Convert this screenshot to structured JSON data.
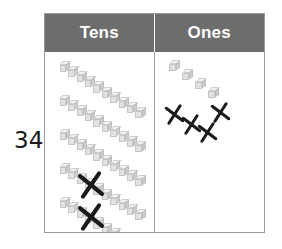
{
  "worksheet": {
    "number_label": "34",
    "table": {
      "columns": [
        {
          "id": "tens",
          "header": "Tens"
        },
        {
          "id": "ones",
          "header": "Ones"
        }
      ],
      "header_bg": "#6d6d6d",
      "header_text_color": "#ffffff",
      "border_color": "#9a9a9a",
      "cell_bg": "#ffffff"
    },
    "tens_column": {
      "manipulative": "rod-of-ten-cubes",
      "cubes_per_rod": 10,
      "rods_shown": 5,
      "rods_crossed_out": 2,
      "rods_remaining": 3,
      "rods": [
        {
          "index": 1,
          "x": 14,
          "y": 9,
          "crossed": false
        },
        {
          "index": 2,
          "x": 14,
          "y": 43,
          "crossed": false
        },
        {
          "index": 3,
          "x": 14,
          "y": 77,
          "crossed": false
        },
        {
          "index": 4,
          "x": 14,
          "y": 111,
          "crossed": true
        },
        {
          "index": 5,
          "x": 14,
          "y": 145,
          "crossed": false
        }
      ],
      "cross_marks": [
        {
          "x": 46,
          "y": 133,
          "size": 26,
          "rotation": -8
        },
        {
          "x": 46,
          "y": 165,
          "size": 26,
          "rotation": -8
        }
      ],
      "cube_color": "#e2e2e2",
      "cube_top_color": "#f3f3f3",
      "cube_side_color": "#cdcdcd"
    },
    "ones_column": {
      "manipulative": "single-unit-cube",
      "cubes_shown": 4,
      "cubes_crossed_out": 4,
      "cubes_remaining": 0,
      "cubes": [
        {
          "index": 1,
          "x": 14,
          "y": 8
        },
        {
          "index": 2,
          "x": 27,
          "y": 17
        },
        {
          "index": 3,
          "x": 40,
          "y": 26
        },
        {
          "index": 4,
          "x": 53,
          "y": 35
        },
        {
          "index": 5,
          "x": 66,
          "y": 44
        }
      ],
      "cross_marks": [
        {
          "x": 20,
          "y": 62,
          "size": 19,
          "rotation": -10
        },
        {
          "x": 37,
          "y": 72,
          "size": 19,
          "rotation": -10
        },
        {
          "x": 53,
          "y": 80,
          "size": 19,
          "rotation": -10
        },
        {
          "x": 66,
          "y": 60,
          "size": 19,
          "rotation": -10
        }
      ]
    }
  }
}
